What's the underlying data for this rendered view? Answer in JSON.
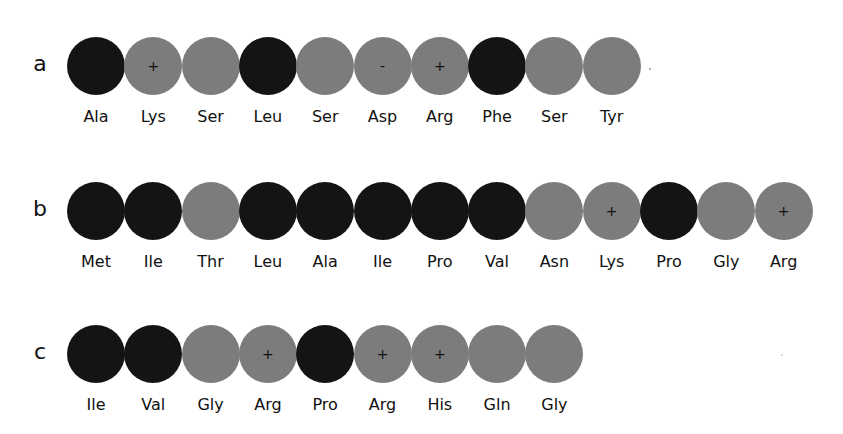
{
  "colors": {
    "hydrophobic": "#141414",
    "polar": "#7c7c7c"
  },
  "rows": [
    {
      "label": "a",
      "residues": [
        {
          "name": "Ala",
          "type": "hydrophobic",
          "charge": ""
        },
        {
          "name": "Lys",
          "type": "polar",
          "charge": "+"
        },
        {
          "name": "Ser",
          "type": "polar",
          "charge": ""
        },
        {
          "name": "Leu",
          "type": "hydrophobic",
          "charge": ""
        },
        {
          "name": "Ser",
          "type": "polar",
          "charge": ""
        },
        {
          "name": "Asp",
          "type": "polar",
          "charge": "-"
        },
        {
          "name": "Arg",
          "type": "polar",
          "charge": "+"
        },
        {
          "name": "Phe",
          "type": "hydrophobic",
          "charge": ""
        },
        {
          "name": "Ser",
          "type": "polar",
          "charge": ""
        },
        {
          "name": "Tyr",
          "type": "polar",
          "charge": ""
        }
      ]
    },
    {
      "label": "b",
      "residues": [
        {
          "name": "Met",
          "type": "hydrophobic",
          "charge": ""
        },
        {
          "name": "Ile",
          "type": "hydrophobic",
          "charge": ""
        },
        {
          "name": "Thr",
          "type": "polar",
          "charge": ""
        },
        {
          "name": "Leu",
          "type": "hydrophobic",
          "charge": ""
        },
        {
          "name": "Ala",
          "type": "hydrophobic",
          "charge": ""
        },
        {
          "name": "Ile",
          "type": "hydrophobic",
          "charge": ""
        },
        {
          "name": "Pro",
          "type": "hydrophobic",
          "charge": ""
        },
        {
          "name": "Val",
          "type": "hydrophobic",
          "charge": ""
        },
        {
          "name": "Asn",
          "type": "polar",
          "charge": ""
        },
        {
          "name": "Lys",
          "type": "polar",
          "charge": "+"
        },
        {
          "name": "Pro",
          "type": "hydrophobic",
          "charge": ""
        },
        {
          "name": "Gly",
          "type": "polar",
          "charge": ""
        },
        {
          "name": "Arg",
          "type": "polar",
          "charge": "+"
        }
      ]
    },
    {
      "label": "c",
      "residues": [
        {
          "name": "Ile",
          "type": "hydrophobic",
          "charge": ""
        },
        {
          "name": "Val",
          "type": "hydrophobic",
          "charge": ""
        },
        {
          "name": "Gly",
          "type": "polar",
          "charge": ""
        },
        {
          "name": "Arg",
          "type": "polar",
          "charge": "+"
        },
        {
          "name": "Pro",
          "type": "hydrophobic",
          "charge": ""
        },
        {
          "name": "Arg",
          "type": "polar",
          "charge": "+"
        },
        {
          "name": "His",
          "type": "polar",
          "charge": "+"
        },
        {
          "name": "Gln",
          "type": "polar",
          "charge": ""
        },
        {
          "name": "Gly",
          "type": "polar",
          "charge": ""
        }
      ]
    }
  ]
}
